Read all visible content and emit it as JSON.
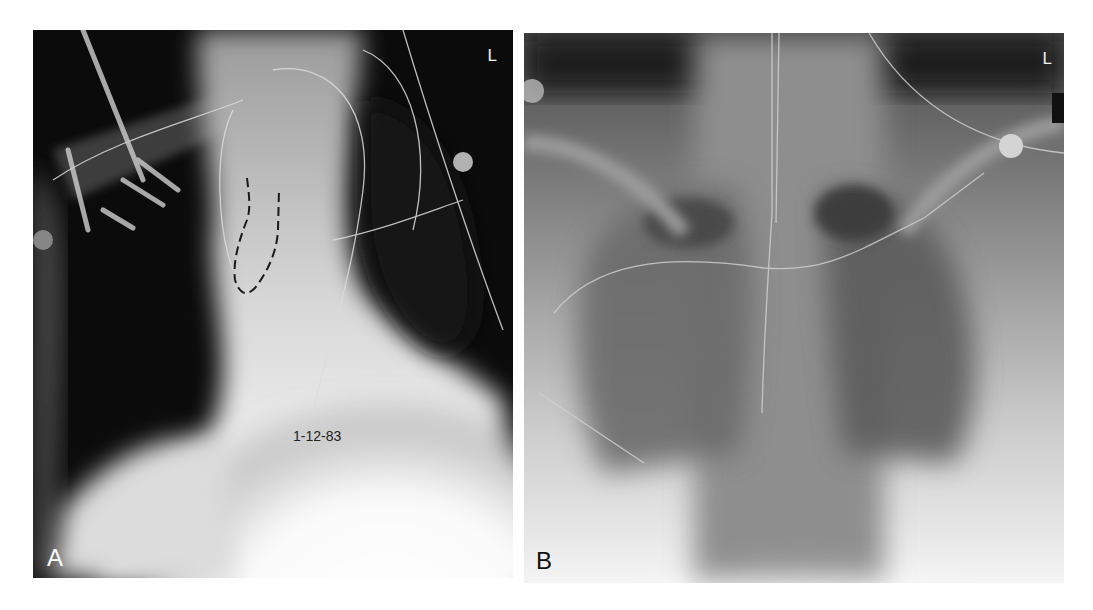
{
  "figure": {
    "panels": [
      {
        "id": "A",
        "letter": "A",
        "side_marker": "L",
        "date_label": "1-12-83",
        "annotation": "dashed outline over superior mediastinum / right paratracheal region"
      },
      {
        "id": "B",
        "letter": "B",
        "side_marker": "L"
      }
    ]
  }
}
